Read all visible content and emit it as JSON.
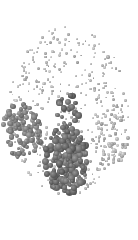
{
  "figure": {
    "background": "#ffffff",
    "dot_color_light": "#9a9a9a",
    "dot_color_dark": "#5f5f5f",
    "outline": {
      "cx": 69,
      "cy": 122,
      "rx": 66,
      "ry": 96
    },
    "clusters": [
      {
        "name": "sparse-field",
        "cx": 69,
        "cy": 110,
        "rx": 60,
        "ry": 85,
        "count": 420,
        "rmin": 0.8,
        "rmax": 1.6,
        "shade": "light"
      },
      {
        "name": "left-posterior",
        "cx": 22,
        "cy": 130,
        "rx": 20,
        "ry": 28,
        "count": 110,
        "rmin": 1.6,
        "rmax": 3.0,
        "shade": "mid"
      },
      {
        "name": "central-posterior",
        "cx": 66,
        "cy": 160,
        "rx": 22,
        "ry": 34,
        "count": 190,
        "rmin": 2.0,
        "rmax": 3.6,
        "shade": "dark"
      },
      {
        "name": "central-upper",
        "cx": 68,
        "cy": 110,
        "rx": 12,
        "ry": 16,
        "count": 22,
        "rmin": 1.8,
        "rmax": 3.4,
        "shade": "dark"
      },
      {
        "name": "right-posterior",
        "cx": 112,
        "cy": 135,
        "rx": 18,
        "ry": 30,
        "count": 70,
        "rmin": 1.0,
        "rmax": 2.0,
        "shade": "light"
      }
    ]
  }
}
